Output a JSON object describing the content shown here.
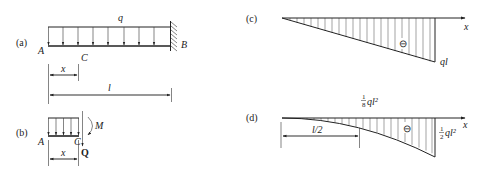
{
  "figure": {
    "panels": {
      "a": {
        "tag": "(a)",
        "load_label": "q",
        "point_A": "A",
        "point_B": "B",
        "point_C": "C",
        "dim_x": "x",
        "dim_l": "l",
        "load_arrow_count": 9,
        "support": "fixed wall at B"
      },
      "b": {
        "tag": "(b)",
        "point_A": "A",
        "point_C": "C",
        "moment_label": "M",
        "shear_label": "Q",
        "dim_x": "x",
        "load_arrow_count": 5
      },
      "c": {
        "tag": "(c)",
        "axis_label": "x",
        "sign": "⊖",
        "end_value": "ql",
        "shape": "linear triangle (shear force diagram)"
      },
      "d": {
        "tag": "(d)",
        "axis_label": "x",
        "sign": "⊖",
        "mid_value_num": "1",
        "mid_value_den": "8",
        "mid_value_tail": "ql²",
        "end_value_num": "1",
        "end_value_den": "2",
        "end_value_tail": "ql²",
        "dim_half": "l/2",
        "shape": "parabola (bending moment diagram)"
      }
    }
  }
}
